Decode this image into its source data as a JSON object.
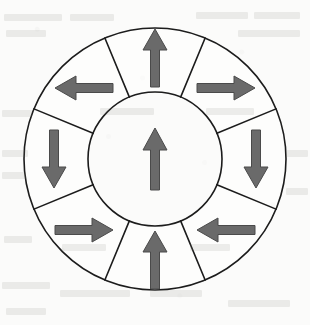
{
  "figure": {
    "name": "segmented-ring-arrow-diagram",
    "canvas": {
      "width": 310,
      "height": 325
    },
    "background_color": "#fbfbfa",
    "stroke_color": "#1c1c1c",
    "arrow_fill_color": "#6a6a6a",
    "arrow_stroke_color": "#4a4a4a",
    "stroke_width": 1.6,
    "geometry": {
      "center_x": 155,
      "center_y": 159,
      "outer_radius": 131,
      "inner_radius": 67,
      "sector_count": 8,
      "sector_span_degrees": 45,
      "spoke_offset_degrees": 22.5
    }
  },
  "center_element": {
    "label": "center-circle",
    "radius": 67,
    "arrow": {
      "name": "center-arrow",
      "direction": "up",
      "rotation_degrees": 0,
      "length": 62,
      "shaft_width": 9,
      "head_width": 24,
      "head_length": 22
    }
  },
  "sectors": [
    {
      "index": 0,
      "position": "top",
      "center_angle_degrees": 0,
      "arrow_direction": "up",
      "arrow_rotation_degrees": 0,
      "arrow_center_x": 155,
      "arrow_center_y": 58
    },
    {
      "index": 1,
      "position": "top-right",
      "center_angle_degrees": 45,
      "arrow_direction": "right",
      "arrow_rotation_degrees": 90,
      "arrow_center_x": 226,
      "arrow_center_y": 88
    },
    {
      "index": 2,
      "position": "right",
      "center_angle_degrees": 90,
      "arrow_direction": "down",
      "arrow_rotation_degrees": 180,
      "arrow_center_x": 256,
      "arrow_center_y": 159
    },
    {
      "index": 3,
      "position": "bottom-right",
      "center_angle_degrees": 135,
      "arrow_direction": "left",
      "arrow_rotation_degrees": 270,
      "arrow_center_x": 226,
      "arrow_center_y": 230
    },
    {
      "index": 4,
      "position": "bottom",
      "center_angle_degrees": 180,
      "arrow_direction": "up",
      "arrow_rotation_degrees": 0,
      "arrow_center_x": 155,
      "arrow_center_y": 260
    },
    {
      "index": 5,
      "position": "bottom-left",
      "center_angle_degrees": 225,
      "arrow_direction": "right",
      "arrow_rotation_degrees": 90,
      "arrow_center_x": 84,
      "arrow_center_y": 230
    },
    {
      "index": 6,
      "position": "left",
      "center_angle_degrees": 270,
      "arrow_direction": "down",
      "arrow_rotation_degrees": 180,
      "arrow_center_x": 54,
      "arrow_center_y": 159
    },
    {
      "index": 7,
      "position": "top-left",
      "center_angle_degrees": 315,
      "arrow_direction": "left",
      "arrow_rotation_degrees": 270,
      "arrow_center_x": 84,
      "arrow_center_y": 88
    }
  ],
  "sector_arrow_style": {
    "length": 58,
    "shaft_width": 9,
    "head_width": 24,
    "head_length": 21
  },
  "background_ghost_text": [
    {
      "x": 4,
      "y": 14,
      "width": 58
    },
    {
      "x": 70,
      "y": 14,
      "width": 44
    },
    {
      "x": 196,
      "y": 12,
      "width": 52
    },
    {
      "x": 254,
      "y": 12,
      "width": 46
    },
    {
      "x": 6,
      "y": 30,
      "width": 40
    },
    {
      "x": 238,
      "y": 30,
      "width": 62
    },
    {
      "x": 2,
      "y": 110,
      "width": 30
    },
    {
      "x": 100,
      "y": 108,
      "width": 54
    },
    {
      "x": 206,
      "y": 108,
      "width": 48
    },
    {
      "x": 2,
      "y": 150,
      "width": 26
    },
    {
      "x": 2,
      "y": 172,
      "width": 24
    },
    {
      "x": 286,
      "y": 150,
      "width": 22
    },
    {
      "x": 286,
      "y": 188,
      "width": 22
    },
    {
      "x": 4,
      "y": 236,
      "width": 28
    },
    {
      "x": 62,
      "y": 244,
      "width": 44
    },
    {
      "x": 190,
      "y": 244,
      "width": 40
    },
    {
      "x": 2,
      "y": 282,
      "width": 48
    },
    {
      "x": 60,
      "y": 290,
      "width": 70
    },
    {
      "x": 150,
      "y": 290,
      "width": 52
    },
    {
      "x": 228,
      "y": 300,
      "width": 62
    },
    {
      "x": 6,
      "y": 308,
      "width": 40
    }
  ]
}
